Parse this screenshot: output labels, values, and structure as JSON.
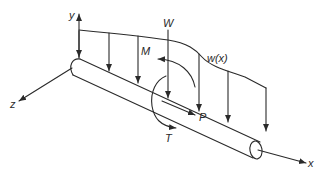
{
  "diagram": {
    "axes": {
      "x_label": "x",
      "y_label": "y",
      "z_label": "z"
    },
    "loads": {
      "point_load_label": "W",
      "moment_label": "M",
      "distributed_load_label": "w(x)",
      "axial_load_label": "P",
      "torque_label": "T"
    },
    "colors": {
      "line": "#2a2a2a",
      "background": "#ffffff"
    }
  }
}
